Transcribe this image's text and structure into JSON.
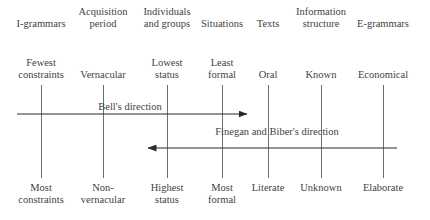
{
  "figure": {
    "background_color": "#ffffff",
    "line_color": "#6f6f6f",
    "arrow_color": "#2b2b2b",
    "text_color": "#3f3f3f"
  },
  "columns": [
    {
      "id": "i-grammars",
      "x": 41,
      "header": "I-grammars",
      "header_line2": "",
      "top_line1": "Fewest",
      "top_line2": "constraints",
      "bottom_line1": "Most",
      "bottom_line2": "constraints"
    },
    {
      "id": "acquisition-period",
      "x": 103,
      "header": "Acquisition",
      "header_line2": "period",
      "top_line1": "Vernacular",
      "top_line2": "",
      "bottom_line1": "Non-",
      "bottom_line2": "vernacular"
    },
    {
      "id": "individuals-and-groups",
      "x": 167,
      "header": "Individuals",
      "header_line2": "and groups",
      "top_line1": "Lowest",
      "top_line2": "status",
      "bottom_line1": "Highest",
      "bottom_line2": "status"
    },
    {
      "id": "situations",
      "x": 222,
      "header": "Situations",
      "header_line2": "",
      "top_line1": "Least",
      "top_line2": "formal",
      "bottom_line1": "Most",
      "bottom_line2": "formal"
    },
    {
      "id": "texts",
      "x": 268,
      "header": "Texts",
      "header_line2": "",
      "top_line1": "Oral",
      "top_line2": "",
      "bottom_line1": "Literate",
      "bottom_line2": ""
    },
    {
      "id": "information-structure",
      "x": 321,
      "header": "Information",
      "header_line2": "structure",
      "top_line1": "Known",
      "top_line2": "",
      "bottom_line1": "Unknown",
      "bottom_line2": ""
    },
    {
      "id": "e-grammars",
      "x": 383,
      "header": "E-grammars",
      "header_line2": "",
      "top_line1": "Economical",
      "top_line2": "",
      "bottom_line1": "Elaborate",
      "bottom_line2": ""
    }
  ],
  "arrows": [
    {
      "id": "bell-direction",
      "label": "Bell's direction",
      "label_x": 130,
      "direction": "right",
      "x_start": 17,
      "x_end": 247,
      "y": 114
    },
    {
      "id": "finegan-biber-direction",
      "label": "Finegan and Biber's direction",
      "label_x": 277,
      "direction": "left",
      "x_start": 397,
      "x_end": 148,
      "y": 148
    }
  ]
}
